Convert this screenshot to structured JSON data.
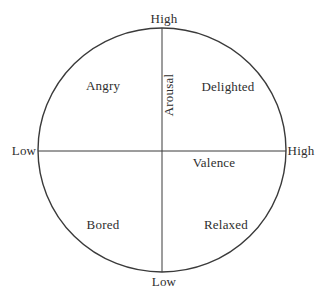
{
  "diagram": {
    "type": "circumplex-model",
    "axes": {
      "vertical_label": "Arousal",
      "horizontal_label": "Valence",
      "top_end_label": "High",
      "bottom_end_label": "Low",
      "left_end_label": "Low",
      "right_end_label": "High"
    },
    "quadrants": {
      "top_left": "Angry",
      "top_right": "Delighted",
      "bottom_left": "Bored",
      "bottom_right": "Relaxed"
    },
    "colors": {
      "line": "#3a3a3a",
      "text": "#2e2e2e",
      "background": "#ffffff"
    }
  }
}
